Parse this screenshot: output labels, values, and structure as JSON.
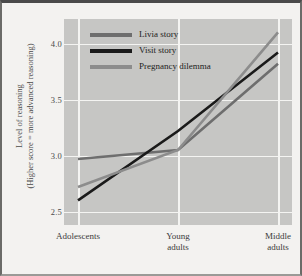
{
  "chart_data": {
    "type": "line",
    "title": "",
    "xlabel": "",
    "ylabel_line1": "Level of reasoning",
    "ylabel_line2": "(Higher score = more advanced reasoning)",
    "categories": [
      "Adolescents",
      "Young adults",
      "Middle adults"
    ],
    "category_lines": [
      [
        "Adolescents"
      ],
      [
        "Young",
        "adults"
      ],
      [
        "Middle",
        "adults"
      ]
    ],
    "series": [
      {
        "name": "Livia story",
        "values": [
          2.97,
          3.05,
          3.82
        ],
        "color": "#6e6e6e"
      },
      {
        "name": "Visit story",
        "values": [
          2.6,
          3.22,
          3.92
        ],
        "color": "#1a1a1a"
      },
      {
        "name": "Pregnancy dilemma",
        "values": [
          2.72,
          3.05,
          4.1
        ],
        "color": "#8c8c8c"
      }
    ],
    "yticks": [
      4.0,
      3.5,
      3.0,
      2.5
    ],
    "ytick_labels": [
      "4.0",
      "3.5",
      "3.0",
      "2.5"
    ],
    "ylim": [
      2.38,
      4.22
    ],
    "grid": true,
    "grid_color": "#f4f4f2",
    "plot_background": "#c6c6c4",
    "figure_background": "#f3f2f0",
    "legend_position": "top-left-inside"
  }
}
